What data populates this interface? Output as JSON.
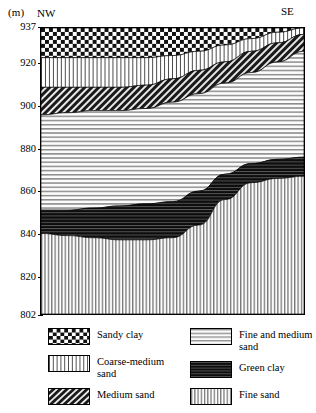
{
  "axis": {
    "unit_label": "(m)",
    "direction_left": "NW",
    "direction_right": "SE",
    "ticks": [
      "937",
      "920",
      "900",
      "880",
      "860",
      "840",
      "820",
      "802"
    ]
  },
  "legend": {
    "left_column": [
      {
        "label": "Sandy clay",
        "pattern": "checker"
      },
      {
        "label": "Coarse-medium\nsand",
        "pattern": "vertical-fine"
      },
      {
        "label": "Medium sand",
        "pattern": "diagonal"
      }
    ],
    "right_column": [
      {
        "label": "Fine and medium\nsand",
        "pattern": "horizontal"
      },
      {
        "label": "Green clay",
        "pattern": "horizontal-dark"
      },
      {
        "label": "Fine sand",
        "pattern": "vertical"
      }
    ]
  },
  "chart_data": {
    "type": "area",
    "title": "",
    "xlabel": "",
    "ylabel": "(m)",
    "ylim": [
      802,
      937
    ],
    "xlim": [
      0,
      100
    ],
    "grid": false,
    "legend_position": "bottom",
    "x_axis_direction": "NW to SE",
    "tick_values": [
      937,
      920,
      900,
      880,
      860,
      840,
      820,
      802
    ],
    "x": [
      0,
      10,
      20,
      30,
      40,
      50,
      60,
      70,
      80,
      90,
      100
    ],
    "series": [
      {
        "name": "Sandy clay",
        "pattern": "checker",
        "top_surface": [
          937,
          937,
          937,
          937,
          937,
          937,
          937,
          937,
          937,
          937,
          937
        ],
        "base_surface": [
          923,
          923,
          923,
          923,
          923,
          924,
          926,
          929,
          932,
          935,
          937
        ]
      },
      {
        "name": "Coarse-medium sand",
        "pattern": "vertical-fine",
        "top_surface": [
          923,
          923,
          923,
          923,
          923,
          924,
          926,
          929,
          932,
          935,
          937
        ],
        "base_surface": [
          909,
          909,
          909,
          909,
          910,
          913,
          917,
          921,
          926,
          930,
          934
        ]
      },
      {
        "name": "Medium sand",
        "pattern": "diagonal",
        "top_surface": [
          909,
          909,
          909,
          909,
          910,
          913,
          917,
          921,
          926,
          930,
          934
        ],
        "base_surface": [
          896,
          897,
          898,
          898,
          899,
          902,
          906,
          911,
          916,
          921,
          926
        ]
      },
      {
        "name": "Fine and medium sand",
        "pattern": "horizontal",
        "top_surface": [
          896,
          897,
          898,
          898,
          899,
          902,
          906,
          911,
          916,
          921,
          926
        ],
        "base_surface": [
          851,
          851,
          852,
          853,
          854,
          855,
          860,
          868,
          873,
          875,
          876
        ]
      },
      {
        "name": "Green clay",
        "pattern": "horizontal-dark",
        "top_surface": [
          851,
          851,
          852,
          853,
          854,
          855,
          860,
          868,
          873,
          875,
          876
        ],
        "base_surface": [
          840,
          839,
          838,
          837,
          837,
          838,
          844,
          856,
          864,
          866,
          867
        ]
      },
      {
        "name": "Fine sand",
        "pattern": "vertical",
        "top_surface": [
          840,
          839,
          838,
          837,
          837,
          838,
          844,
          856,
          864,
          866,
          867
        ],
        "base_surface": [
          802,
          802,
          802,
          802,
          802,
          802,
          802,
          802,
          802,
          802,
          802
        ]
      }
    ]
  }
}
